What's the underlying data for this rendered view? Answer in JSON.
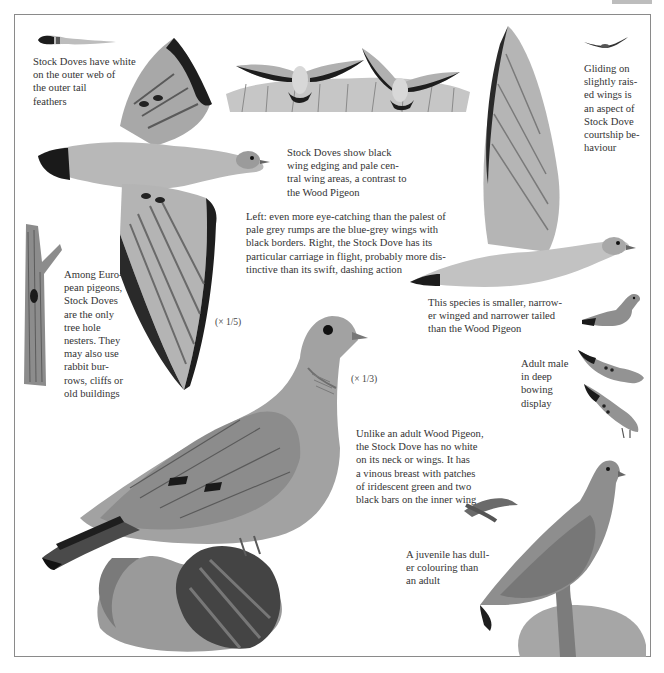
{
  "page": {
    "colors": {
      "frame": "#8a8a8a",
      "ink": "#333333",
      "plumage_grey": "#9a9a9a",
      "wing_black": "#1e1e1e"
    }
  },
  "captions": {
    "tail_feather": [
      "Stock Doves have white",
      "on the outer web of",
      "the outer tail",
      "feathers"
    ],
    "flight_pair": [
      "Stock Doves show black",
      "wing edging and pale cen-",
      "tral wing areas, a contrast to",
      "the Wood Pigeon"
    ],
    "gliding": [
      "Gliding on",
      "slightly rais-",
      "ed wings is",
      "an aspect of",
      "Stock Dove",
      "courtship be-",
      "haviour"
    ],
    "rumps": [
      "Left: even more eye-catching than the palest of",
      "pale grey rumps are the blue-grey wings with",
      "black borders. Right, the Stock Dove has its",
      "particular carriage in flight, probably more dis-",
      "tinctive than its swift, dashing action"
    ],
    "tree_hole": [
      "Among Euro-",
      "pean pigeons,",
      "Stock Doves",
      "are the only",
      "tree hole",
      "nesters. They",
      "may also use",
      "rabbit bur-",
      "rows, cliffs or",
      "old buildings"
    ],
    "smaller": [
      "This species is smaller, narrow-",
      "er winged and narrower tailed",
      "than the Wood Pigeon"
    ],
    "bowing": [
      "Adult male",
      "in deep",
      "bowing",
      "display"
    ],
    "adult": [
      "Unlike an adult Wood Pigeon,",
      "the Stock Dove has no white",
      "on its neck or wings. It has",
      "a vinous breast with patches",
      "of iridescent green and two",
      "black bars on the inner wing"
    ],
    "juvenile": [
      "A juvenile has dull-",
      "er colouring than",
      "an adult"
    ]
  },
  "scales": {
    "flying_bird": "(× 1/5)",
    "perched_bird": "(× 1/3)"
  },
  "illustrations": [
    "tail-feather",
    "flying-stock-dove-from-above",
    "pair-of-doves-over-reeds",
    "gliding-dove-silhouette",
    "flying-dove-side-view",
    "tree-trunk-with-nest-hole",
    "perched-adult-stock-dove",
    "bowing-display-males",
    "juvenile-on-branch",
    "oak-leaves-and-stump"
  ]
}
